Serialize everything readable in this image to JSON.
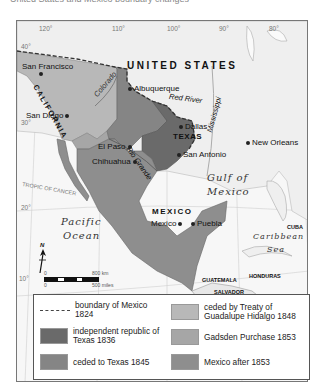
{
  "map": {
    "title_partial": "United States and Mexico boundary changes",
    "colors": {
      "background": "#f7f7f7",
      "boundary_1824": "#444444",
      "texas_1836": "#6a6a6a",
      "ceded_texas_1845": "#858585",
      "guadalupe_hidalgo_1848": "#b8b8b8",
      "gadsden_1853": "#a6a6a6",
      "mexico_after_1853": "#8e8e8e"
    },
    "longitudes": [
      "120°",
      "110°",
      "100°",
      "90°",
      "80°"
    ],
    "latitudes": [
      "40°",
      "30°",
      "20°",
      "10°"
    ],
    "labels": {
      "united_states": "UNITED STATES",
      "california": "CALIFORNIA",
      "texas": "TEXAS",
      "mexico_country": "MEXICO",
      "cuba": "CUBA",
      "guatemala": "GUATEMALA",
      "honduras": "HONDURAS",
      "salvador": "SALVADOR",
      "nicaragua": "NICARAGUA",
      "tropic": "TROPIC OF CANCER",
      "pacific_1": "Pacific",
      "pacific_2": "Ocean",
      "gulf_1": "Gulf of",
      "gulf_2": "Mexico",
      "caribbean_1": "Caribbean",
      "caribbean_2": "Sea"
    },
    "rivers": {
      "colorado": "Colorado",
      "red": "Red River",
      "mississippi": "Mississippi",
      "rio_grande": "Rio Grande"
    },
    "cities": {
      "san_francisco": "San Francisco",
      "san_diego": "San Diego",
      "albuquerque": "Albuquerque",
      "el_paso": "El Paso",
      "chihuahua": "Chihuahua",
      "dallas": "Dallas",
      "san_antonio": "San Antonio",
      "new_orleans": "New Orleans",
      "mexico_city": "Mexico",
      "puebla": "Puebla"
    },
    "compass": "N",
    "scale": {
      "zero_top": "0",
      "zero_bottom": "0",
      "km": "800 km",
      "miles": "500 miles"
    }
  },
  "legend": {
    "items": [
      {
        "label": "boundary of Mexico 1824"
      },
      {
        "label": "independent republic of Texas 1836"
      },
      {
        "label": "ceded to Texas 1845"
      },
      {
        "label": "ceded by Treaty of Guadalupe Hidalgo 1848"
      },
      {
        "label": "Gadsden Purchase 1853"
      },
      {
        "label": "Mexico after 1853"
      }
    ]
  }
}
